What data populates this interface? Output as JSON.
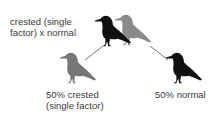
{
  "diagram": {
    "type": "genetic-cross",
    "parents_label": "crested (single\nfactor) x normal",
    "offspring": [
      {
        "label": "50% crested\n(single factor)",
        "bird_color": "#777777"
      },
      {
        "label": "50% normal",
        "bird_color": "#111111"
      }
    ],
    "parents": [
      {
        "name": "normal parent",
        "bird_color": "#111111"
      },
      {
        "name": "crested parent",
        "bird_color": "#8a8a8a"
      }
    ],
    "line_color": "#555555"
  }
}
